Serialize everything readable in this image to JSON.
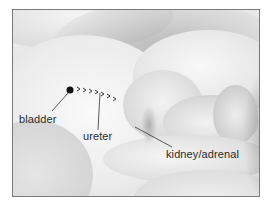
{
  "figure": {
    "labels": {
      "bladder": "bladder",
      "ureter": "ureter",
      "kidney": "kidney/adrenal"
    },
    "arrow_glyphs": ">>>>>>>",
    "colors": {
      "border": "#7a7a7a",
      "label_text": "#2a2a2a",
      "marker": "#111111",
      "leader_line": "#333333"
    }
  }
}
